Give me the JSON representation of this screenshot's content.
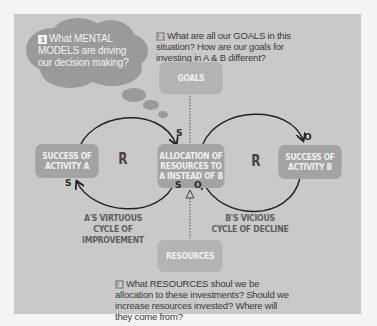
{
  "diagram": {
    "type": "causal-loop",
    "questions": [
      {
        "number": "1",
        "text": "What MENTAL MODELS are driving our decision making?"
      },
      {
        "number": "2",
        "text": "What are all our GOALS in this situation? How are our goals for investing in A & B different?"
      },
      {
        "number": "3",
        "text": "What RESOURCES shoul we be allocation to these investments? Should we increase resources invested? Where will they come from?"
      }
    ],
    "nodes": {
      "goals": "GOALS",
      "success_a": "SUCCESS OF ACTIVITY A",
      "allocation": "ALLOCATION OF RESOURCES TO A INSTEAD OF B",
      "success_b": "SUCCESS OF ACTIVITY B",
      "resources": "RESOURCES"
    },
    "loops": {
      "left_type": "R",
      "right_type": "R",
      "left_label": "A'S VIRTUOUS CYCLE OF IMPROVEMENT",
      "right_label": "B'S VICIOUS CYCLE OF DECLINE"
    },
    "polarities": {
      "a_to_alloc": "S",
      "alloc_to_a": "S",
      "alloc_bottom_left": "S",
      "alloc_bottom_right": "O",
      "alloc_to_b": "O"
    },
    "colors": {
      "panel": "#c9c9c9",
      "box": "#a3a3a3",
      "cloud": "#9a9a9a",
      "arrow": "#222222"
    }
  }
}
